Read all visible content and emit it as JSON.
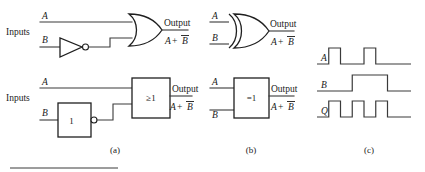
{
  "figure": {
    "panels": [
      {
        "id": "a",
        "label": "(a)"
      },
      {
        "id": "b",
        "label": "(b)"
      },
      {
        "id": "c",
        "label": "(c)"
      }
    ]
  },
  "panel_a": {
    "top_circuit": {
      "inputs_label": "Inputs",
      "input_a": "A",
      "input_b": "B",
      "inverter_symbol": "not-gate-triangle",
      "main_gate_symbol": "or-gate-distinctive",
      "output_label": "Output",
      "output_expression_left": "A",
      "output_expression_op": "+",
      "output_expression_right": "B",
      "output_expression_full": "A + B̅"
    },
    "bottom_circuit": {
      "inputs_label": "Inputs",
      "input_a": "A",
      "input_b": "B",
      "inverter_box_label": "1",
      "main_box_label": "≥1",
      "output_label": "Output",
      "output_expression_left": "A",
      "output_expression_op": "+",
      "output_expression_right": "B",
      "output_expression_full": "A + B̅"
    }
  },
  "panel_b": {
    "top_circuit": {
      "input_a": "A",
      "input_b": "B",
      "main_gate_symbol": "xor-gate-distinctive",
      "output_label": "Output",
      "output_expression_left": "A",
      "output_expression_op": "+",
      "output_expression_right": "B",
      "output_expression_full": "A + B̅"
    },
    "bottom_circuit": {
      "input_a": "A",
      "input_b": "B",
      "main_box_label": "=1",
      "output_label": "Output",
      "output_expression_left": "A",
      "output_expression_op": "+",
      "output_expression_right": "B",
      "output_expression_full": "A + B̅"
    }
  },
  "panel_c": {
    "signals": [
      {
        "name": "A",
        "label": "A"
      },
      {
        "name": "B",
        "label": "B"
      },
      {
        "name": "Q",
        "label": "Q"
      }
    ]
  },
  "chart_data": {
    "type": "line",
    "xlabel": "",
    "ylabel": "",
    "x": [
      0,
      1,
      2,
      3,
      4,
      5,
      6,
      7
    ],
    "series": [
      {
        "name": "A",
        "values": [
          0,
          1,
          0,
          0,
          1,
          0,
          0,
          0
        ]
      },
      {
        "name": "B",
        "values": [
          0,
          0,
          0,
          1,
          1,
          1,
          0,
          0
        ]
      },
      {
        "name": "Q",
        "values": [
          0,
          1,
          0,
          1,
          0,
          1,
          0,
          0
        ]
      }
    ],
    "ylim": [
      0,
      1
    ],
    "grid": false,
    "legend": "none"
  }
}
